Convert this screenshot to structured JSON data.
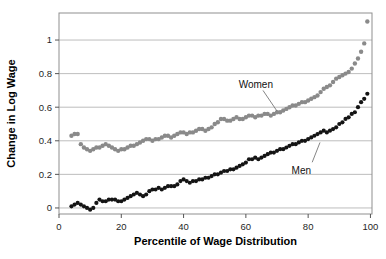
{
  "figure": {
    "background": "#ffffff",
    "frame_color": "#8f8f8f",
    "grid_color": "#b5b5b5",
    "tick_color": "#555555",
    "text_color": "#1f1f1f"
  },
  "chart_data": {
    "type": "scatter",
    "title": "",
    "xlabel": "Percentile of Wage Distribution",
    "ylabel": "Change in Log Wage",
    "xlim": [
      0,
      100.5
    ],
    "ylim": [
      -0.036,
      1.161
    ],
    "grid": true,
    "legend_position": "none",
    "x_ticks": [
      0,
      20,
      40,
      60,
      80,
      100
    ],
    "x_tick_labels": [
      "0",
      "20",
      "40",
      "60",
      "80",
      "100"
    ],
    "y_ticks": [
      0,
      0.2,
      0.4,
      0.6,
      0.8,
      1
    ],
    "y_tick_labels": [
      "0",
      "0.2",
      "0.4",
      "0.6",
      "0.8",
      "1"
    ],
    "x": [
      4,
      5,
      6,
      7,
      8,
      9,
      10,
      11,
      12,
      13,
      14,
      15,
      16,
      17,
      18,
      19,
      20,
      21,
      22,
      23,
      24,
      25,
      26,
      27,
      28,
      29,
      30,
      31,
      32,
      33,
      34,
      35,
      36,
      37,
      38,
      39,
      40,
      41,
      42,
      43,
      44,
      45,
      46,
      47,
      48,
      49,
      50,
      51,
      52,
      53,
      54,
      55,
      56,
      57,
      58,
      59,
      60,
      61,
      62,
      63,
      64,
      65,
      66,
      67,
      68,
      69,
      70,
      71,
      72,
      73,
      74,
      75,
      76,
      77,
      78,
      79,
      80,
      81,
      82,
      83,
      84,
      85,
      86,
      87,
      88,
      89,
      90,
      91,
      92,
      93,
      94,
      95,
      96,
      97,
      98,
      99
    ],
    "series": [
      {
        "name": "Women",
        "color": "#8a8a8a",
        "marker_radius": 2.2,
        "values": [
          0.43,
          0.44,
          0.44,
          0.38,
          0.36,
          0.35,
          0.34,
          0.35,
          0.36,
          0.36,
          0.37,
          0.38,
          0.37,
          0.36,
          0.35,
          0.34,
          0.35,
          0.35,
          0.36,
          0.37,
          0.37,
          0.38,
          0.39,
          0.4,
          0.41,
          0.41,
          0.4,
          0.41,
          0.41,
          0.42,
          0.43,
          0.43,
          0.42,
          0.43,
          0.44,
          0.45,
          0.45,
          0.44,
          0.45,
          0.45,
          0.46,
          0.47,
          0.47,
          0.46,
          0.47,
          0.48,
          0.5,
          0.51,
          0.53,
          0.53,
          0.52,
          0.52,
          0.53,
          0.54,
          0.53,
          0.53,
          0.54,
          0.55,
          0.55,
          0.54,
          0.55,
          0.55,
          0.56,
          0.56,
          0.55,
          0.56,
          0.57,
          0.57,
          0.58,
          0.59,
          0.6,
          0.61,
          0.61,
          0.62,
          0.63,
          0.63,
          0.64,
          0.65,
          0.66,
          0.67,
          0.69,
          0.71,
          0.72,
          0.73,
          0.75,
          0.77,
          0.78,
          0.79,
          0.8,
          0.81,
          0.83,
          0.86,
          0.89,
          0.93,
          0.98,
          1.11
        ]
      },
      {
        "name": "Men",
        "color": "#141414",
        "marker_radius": 2.1,
        "values": [
          0.01,
          0.02,
          0.03,
          0.02,
          0.01,
          0.0,
          -0.01,
          0.0,
          0.03,
          0.05,
          0.04,
          0.04,
          0.05,
          0.05,
          0.05,
          0.04,
          0.04,
          0.05,
          0.06,
          0.07,
          0.08,
          0.09,
          0.08,
          0.07,
          0.08,
          0.1,
          0.11,
          0.11,
          0.12,
          0.11,
          0.12,
          0.13,
          0.13,
          0.13,
          0.14,
          0.16,
          0.17,
          0.16,
          0.15,
          0.16,
          0.16,
          0.17,
          0.17,
          0.18,
          0.18,
          0.19,
          0.2,
          0.2,
          0.21,
          0.22,
          0.22,
          0.23,
          0.23,
          0.24,
          0.25,
          0.26,
          0.27,
          0.29,
          0.29,
          0.3,
          0.29,
          0.3,
          0.31,
          0.32,
          0.33,
          0.33,
          0.34,
          0.35,
          0.35,
          0.36,
          0.37,
          0.38,
          0.38,
          0.39,
          0.4,
          0.4,
          0.41,
          0.42,
          0.43,
          0.44,
          0.45,
          0.46,
          0.45,
          0.46,
          0.47,
          0.48,
          0.5,
          0.51,
          0.53,
          0.54,
          0.56,
          0.57,
          0.6,
          0.63,
          0.65,
          0.68
        ]
      }
    ],
    "annotations": [
      {
        "text": "Women",
        "x": 63.2,
        "y": 0.738,
        "leader_from": [
          65.5,
          0.7
        ],
        "leader_to": [
          70.0,
          0.577
        ]
      },
      {
        "text": "Men",
        "x": 77.8,
        "y": 0.225,
        "leader_from": [
          81.3,
          0.272
        ],
        "leader_to": [
          83.8,
          0.39
        ]
      }
    ]
  }
}
